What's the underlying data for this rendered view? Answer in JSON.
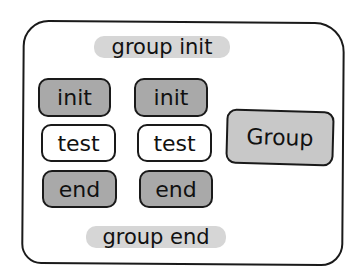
{
  "diagram": {
    "group_init": "group init",
    "group_end": "group end",
    "columns": [
      {
        "init": "init",
        "test": "test",
        "end": "end"
      },
      {
        "init": "init",
        "test": "test",
        "end": "end"
      }
    ],
    "group_box": "Group"
  },
  "colors": {
    "dark_fill": "#a9a9a9",
    "light_fill": "#ffffff",
    "group_fill": "#c8c8c8",
    "highlight": "#d6d6d6",
    "stroke": "#1a1a1a"
  }
}
